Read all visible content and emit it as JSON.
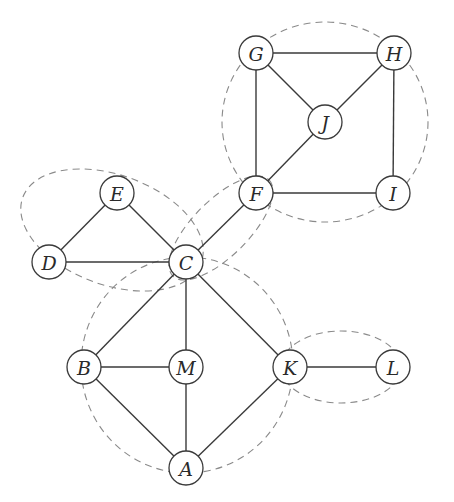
{
  "diagram": {
    "type": "graph",
    "nodes": [
      {
        "id": "A",
        "label": "A",
        "x": 186,
        "y": 468
      },
      {
        "id": "B",
        "label": "B",
        "x": 84,
        "y": 367
      },
      {
        "id": "C",
        "label": "C",
        "x": 186,
        "y": 262
      },
      {
        "id": "D",
        "label": "D",
        "x": 49,
        "y": 262
      },
      {
        "id": "E",
        "label": "E",
        "x": 117,
        "y": 193
      },
      {
        "id": "F",
        "label": "F",
        "x": 256,
        "y": 193
      },
      {
        "id": "G",
        "label": "G",
        "x": 256,
        "y": 53
      },
      {
        "id": "H",
        "label": "H",
        "x": 394,
        "y": 53
      },
      {
        "id": "I",
        "label": "I",
        "x": 393,
        "y": 193
      },
      {
        "id": "J",
        "label": "J",
        "x": 325,
        "y": 122
      },
      {
        "id": "K",
        "label": "K",
        "x": 290,
        "y": 367
      },
      {
        "id": "L",
        "label": "L",
        "x": 393,
        "y": 367
      },
      {
        "id": "M",
        "label": "M",
        "x": 186,
        "y": 367
      }
    ],
    "edges": [
      [
        "G",
        "H"
      ],
      [
        "G",
        "J"
      ],
      [
        "H",
        "J"
      ],
      [
        "G",
        "F"
      ],
      [
        "H",
        "I"
      ],
      [
        "F",
        "I"
      ],
      [
        "F",
        "J"
      ],
      [
        "F",
        "C"
      ],
      [
        "E",
        "C"
      ],
      [
        "D",
        "E"
      ],
      [
        "D",
        "C"
      ],
      [
        "C",
        "B"
      ],
      [
        "C",
        "M"
      ],
      [
        "C",
        "K"
      ],
      [
        "B",
        "M"
      ],
      [
        "B",
        "A"
      ],
      [
        "M",
        "A"
      ],
      [
        "K",
        "A"
      ],
      [
        "K",
        "L"
      ]
    ],
    "groups": [
      {
        "name": "block-FGHIJ",
        "members": [
          "F",
          "G",
          "H",
          "I",
          "J"
        ],
        "cx": 325,
        "cy": 122,
        "rx": 103,
        "ry": 100,
        "rotate": 0
      },
      {
        "name": "block-CDE",
        "members": [
          "C",
          "D",
          "E"
        ],
        "cx": 112,
        "cy": 230,
        "rx": 95,
        "ry": 55,
        "rotate": 20
      },
      {
        "name": "block-CF",
        "members": [
          "C",
          "F"
        ],
        "cx": 221,
        "cy": 228,
        "rx": 68,
        "ry": 28,
        "rotate": -45
      },
      {
        "name": "block-ABCKM",
        "members": [
          "A",
          "B",
          "C",
          "K",
          "M"
        ],
        "cx": 187,
        "cy": 365,
        "rx": 106,
        "ry": 108,
        "rotate": 0
      },
      {
        "name": "block-KL",
        "members": [
          "K",
          "L"
        ],
        "cx": 341,
        "cy": 367,
        "rx": 60,
        "ry": 36,
        "rotate": 0
      }
    ],
    "colors": {
      "edge": "#3a3a3a",
      "group_outline": "#8a8a8a",
      "node_fill": "#ffffff",
      "background": "#ffffff"
    },
    "node_radius": 17
  }
}
